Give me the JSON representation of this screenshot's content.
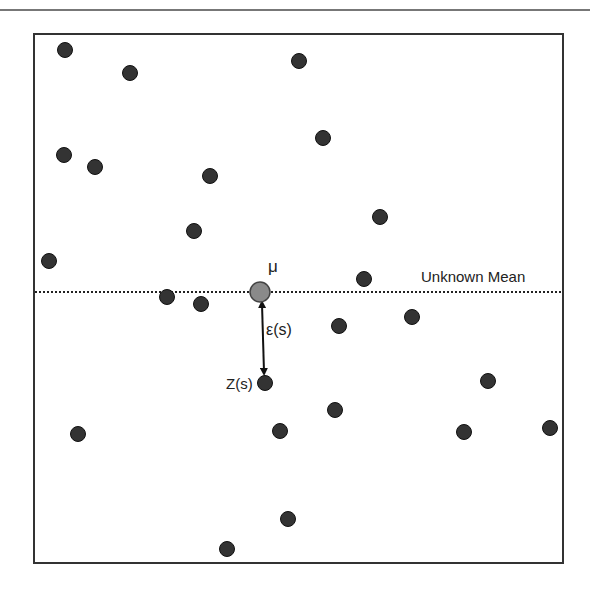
{
  "diagram": {
    "mean_symbol": "μ",
    "mean_line_label": "Unknown Mean",
    "error_label": "ε(s)",
    "observation_label": "Z(s)",
    "colors": {
      "point": "#333333",
      "mean_point": "#8a8a8a",
      "line": "#222222",
      "frame": "#333333"
    },
    "mean_point": {
      "x": 260,
      "y": 292
    },
    "observation_point": {
      "x": 265,
      "y": 383
    },
    "points": [
      {
        "x": 65,
        "y": 50
      },
      {
        "x": 130,
        "y": 73
      },
      {
        "x": 299,
        "y": 61
      },
      {
        "x": 64,
        "y": 155
      },
      {
        "x": 95,
        "y": 167
      },
      {
        "x": 210,
        "y": 176
      },
      {
        "x": 323,
        "y": 138
      },
      {
        "x": 194,
        "y": 231
      },
      {
        "x": 49,
        "y": 261
      },
      {
        "x": 380,
        "y": 217
      },
      {
        "x": 364,
        "y": 279
      },
      {
        "x": 167,
        "y": 297
      },
      {
        "x": 201,
        "y": 304
      },
      {
        "x": 339,
        "y": 326
      },
      {
        "x": 412,
        "y": 317
      },
      {
        "x": 265,
        "y": 383
      },
      {
        "x": 488,
        "y": 381
      },
      {
        "x": 335,
        "y": 410
      },
      {
        "x": 280,
        "y": 431
      },
      {
        "x": 78,
        "y": 434
      },
      {
        "x": 464,
        "y": 432
      },
      {
        "x": 550,
        "y": 428
      },
      {
        "x": 288,
        "y": 519
      },
      {
        "x": 227,
        "y": 549
      }
    ]
  }
}
